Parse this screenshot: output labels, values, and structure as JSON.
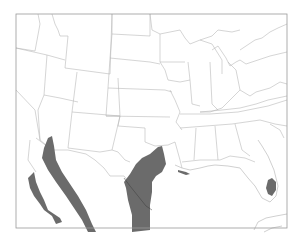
{
  "map": {
    "type": "species range map",
    "region": "Southern United States and Northern Mexico",
    "range_color": "#6b6b6b",
    "border_color": "#b8b8b8",
    "frame": {
      "x": 16,
      "y": 14,
      "width": 271,
      "height": 214
    },
    "range_areas": [
      "baja-california-peninsula",
      "sonora-sinaloa-west-coast-mexico",
      "south-texas-northeast-mexico",
      "south-central-florida"
    ]
  }
}
